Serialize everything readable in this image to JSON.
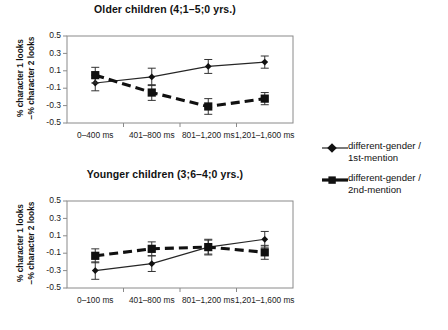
{
  "figure": {
    "background_color": "#ffffff",
    "line_color": "#111111",
    "axis_color": "#8a8a8a"
  },
  "legend": {
    "position": "right",
    "items": [
      {
        "label_line1": "different-gender /",
        "label_line2": "1st-mention",
        "marker": "diamond",
        "line_style": "solid-thin"
      },
      {
        "label_line1": "different-gender /",
        "label_line2": "2nd-mention",
        "marker": "square",
        "line_style": "dashed-thick"
      }
    ]
  },
  "axis_titles": {
    "y_line1": "% character 1 looks",
    "y_line2": "−% character 2 looks"
  },
  "chart_data": [
    {
      "type": "line",
      "title": "Older children (4;1–5;0 yrs.)",
      "xlabel": "",
      "ylabel": "% character 1 looks −% character 2 looks",
      "categories": [
        "0–400 ms",
        "401–800 ms",
        "801–1,200 ms",
        "1,201–1,600 ms"
      ],
      "ylim": [
        -0.5,
        0.5
      ],
      "yticks": [
        0.5,
        0.3,
        0.1,
        -0.1,
        -0.3,
        -0.5
      ],
      "yticklabels": [
        "0.5",
        "0.3",
        "0.1",
        "-0.1",
        "-0.3",
        "-0.5"
      ],
      "grid": false,
      "legend_position": "right",
      "series": [
        {
          "name": "different-gender / 1st-mention",
          "marker": "diamond",
          "line_style": "solid-thin",
          "values": [
            -0.04,
            0.03,
            0.15,
            0.2
          ],
          "errors": [
            0.09,
            0.1,
            0.08,
            0.07
          ]
        },
        {
          "name": "different-gender / 2nd-mention",
          "marker": "square",
          "line_style": "dashed-thick",
          "values": [
            0.05,
            -0.15,
            -0.31,
            -0.22
          ],
          "errors": [
            0.09,
            0.09,
            0.09,
            0.07
          ]
        }
      ]
    },
    {
      "type": "line",
      "title": "Younger children (3;6–4;0 yrs.)",
      "xlabel": "",
      "ylabel": "% character 1 looks −% character 2 looks",
      "categories": [
        "0–100 ms",
        "401–800 ms",
        "801–1,200 ms",
        "1,201–1,600 ms"
      ],
      "ylim": [
        -0.5,
        0.5
      ],
      "yticks": [
        0.5,
        0.3,
        0.1,
        -0.1,
        -0.3,
        -0.5
      ],
      "yticklabels": [
        "0.5",
        "0.3",
        "0.1",
        "-0.1",
        "-0.3",
        "-0.5"
      ],
      "grid": false,
      "legend_position": "right",
      "series": [
        {
          "name": "different-gender / 1st-mention",
          "marker": "diamond",
          "line_style": "solid-thin",
          "values": [
            -0.3,
            -0.22,
            -0.03,
            0.06
          ],
          "errors": [
            0.1,
            0.09,
            0.09,
            0.09
          ]
        },
        {
          "name": "different-gender / 2nd-mention",
          "marker": "square",
          "line_style": "dashed-thick",
          "values": [
            -0.13,
            -0.05,
            -0.03,
            -0.09
          ],
          "errors": [
            0.08,
            0.08,
            0.08,
            0.08
          ]
        }
      ]
    }
  ]
}
